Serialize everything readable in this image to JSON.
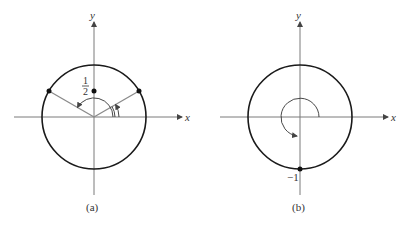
{
  "figure": {
    "panels": [
      {
        "id": "a",
        "caption": "(a)",
        "x_axis_label": "x",
        "y_axis_label": "y",
        "point_label_numerator": "1",
        "point_label_denominator": "2",
        "description": "Unit circle with two rays to points at angles 30° and 150°; arc arrows indicate angles; point at (0, 1/2) on y-axis"
      },
      {
        "id": "b",
        "caption": "(b)",
        "x_axis_label": "x",
        "y_axis_label": "y",
        "point_label": "−1",
        "description": "Unit circle with arc arrow sweeping 270° counterclockwise; point at (0, −1)"
      }
    ],
    "colors": {
      "circle": "#1a1a1a",
      "axes": "#7a7a7a",
      "rays": "#8a8a8a",
      "text": "#333333"
    }
  }
}
